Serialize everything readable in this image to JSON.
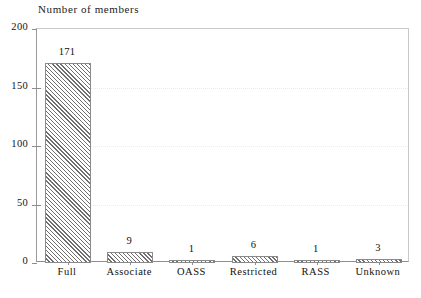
{
  "chart_data": {
    "type": "bar",
    "title": "Number of members",
    "xlabel": "",
    "ylabel": "",
    "categories": [
      "Full",
      "Associate",
      "OASS",
      "Restricted",
      "RASS",
      "Unknown"
    ],
    "values": [
      171,
      9,
      1,
      6,
      1,
      3
    ],
    "value_labels": [
      "171",
      "9",
      "1",
      "6",
      "1",
      "3"
    ],
    "ylim": [
      0,
      200
    ],
    "yticks": [
      0,
      50,
      100,
      150,
      200
    ],
    "ytick_labels": [
      "0",
      "50",
      "100",
      "150",
      "200"
    ],
    "grid": "horizontal-dotted-light",
    "legend": "none",
    "bar_style": {
      "fill": "#ffffff",
      "hatch": "diagonal-45",
      "hatch_color": "#6f6f6f",
      "edge_color": "#8a8a8a"
    },
    "axis_color": "#8e8e8e",
    "text_color": "#111111"
  }
}
